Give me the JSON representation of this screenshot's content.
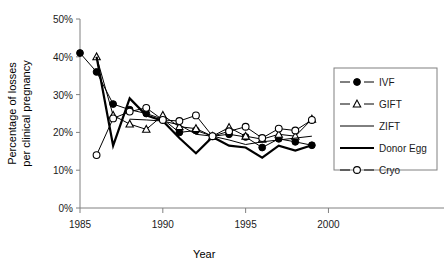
{
  "chart_data": {
    "type": "line",
    "title": "",
    "xlabel": "Year",
    "ylabel": "Percentage of losses per clinical pregnancy",
    "ylabel_lines": [
      "Percentage of losses",
      "per clinical pregnancy"
    ],
    "xlim": [
      1985,
      2001
    ],
    "ylim": [
      0,
      50
    ],
    "xticks": [
      1985,
      1990,
      1995,
      2000
    ],
    "xtick_labels": [
      "1985",
      "1990",
      "1995",
      "2000"
    ],
    "yticks": [
      0,
      10,
      20,
      30,
      40,
      50
    ],
    "ytick_labels": [
      "0%",
      "10%",
      "20%",
      "30%",
      "40%",
      "50%"
    ],
    "grid": false,
    "legend_position": "right",
    "series": [
      {
        "name": "IVF",
        "marker": "filled-circle",
        "line_width": 1,
        "x": [
          1985,
          1986,
          1987,
          1988,
          1989,
          1990,
          1991,
          1992,
          1993,
          1994,
          1995,
          1996,
          1997,
          1998,
          1999
        ],
        "values": [
          41.0,
          36.0,
          27.5,
          26.0,
          25.0,
          23.5,
          20.0,
          20.5,
          19.0,
          19.5,
          18.8,
          16.0,
          18.3,
          17.5,
          16.6
        ]
      },
      {
        "name": "GIFT",
        "marker": "open-triangle",
        "line_width": 1,
        "x": [
          1986,
          1987,
          1988,
          1989,
          1990,
          1991,
          1992,
          1993,
          1994,
          1995,
          1996,
          1997,
          1998,
          1999
        ],
        "values": [
          40.0,
          24.5,
          22.2,
          20.8,
          24.5,
          21.5,
          21.0,
          19.0,
          21.3,
          19.0,
          18.2,
          19.5,
          19.0,
          23.5
        ]
      },
      {
        "name": "ZIFT",
        "marker": "none",
        "line_width": 1,
        "x": [
          1988,
          1989,
          1990,
          1991,
          1992,
          1993,
          1994,
          1995,
          1996,
          1997,
          1998,
          1999
        ],
        "values": [
          23.5,
          23.3,
          23.0,
          22.0,
          19.5,
          19.0,
          18.0,
          16.8,
          17.5,
          18.0,
          18.5,
          19.0
        ]
      },
      {
        "name": "Donor Egg",
        "marker": "none",
        "line_width": 2.2,
        "x": [
          1986,
          1987,
          1988,
          1989,
          1990,
          1991,
          1992,
          1993,
          1994,
          1995,
          1996,
          1997,
          1998,
          1999
        ],
        "values": [
          40.0,
          16.5,
          29.0,
          24.5,
          23.0,
          18.5,
          14.5,
          18.8,
          16.5,
          16.0,
          13.3,
          16.5,
          15.2,
          16.6
        ]
      },
      {
        "name": "Cryo",
        "marker": "open-circle",
        "line_width": 1,
        "x": [
          1986,
          1987,
          1988,
          1989,
          1990,
          1991,
          1992,
          1993,
          1994,
          1995,
          1996,
          1997,
          1998,
          1999
        ],
        "values": [
          14.0,
          23.7,
          25.5,
          26.5,
          23.3,
          23.0,
          24.5,
          19.0,
          20.3,
          21.5,
          18.5,
          21.0,
          20.5,
          23.3
        ]
      }
    ]
  },
  "legend": {
    "items": [
      {
        "label": "IVF",
        "marker": "filled-circle"
      },
      {
        "label": "GIFT",
        "marker": "open-triangle"
      },
      {
        "label": "ZIFT",
        "marker": "none"
      },
      {
        "label": "Donor Egg",
        "marker": "none"
      },
      {
        "label": "Cryo",
        "marker": "open-circle"
      }
    ]
  },
  "colors": {
    "line": "#000000",
    "axis": "#808080",
    "text": "#1a1a1a",
    "background": "#ffffff"
  }
}
